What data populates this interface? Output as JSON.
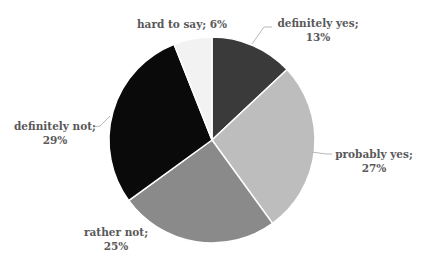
{
  "chart_data": {
    "type": "pie",
    "title": "",
    "categories": [
      "definitely yes",
      "probably yes",
      "rather not",
      "definitely not",
      "hard to say"
    ],
    "values": [
      13,
      27,
      25,
      29,
      6
    ],
    "unit": "%",
    "colors": [
      "#3a3a3a",
      "#bdbdbd",
      "#8a8a8a",
      "#0a0a0a",
      "#f2f2f2"
    ],
    "start_angle_deg": 0,
    "direction": "clockwise",
    "legend": "none",
    "data_labels": [
      {
        "name": "definitely yes;",
        "value": "13%"
      },
      {
        "name": "probably yes;",
        "value": "27%"
      },
      {
        "name": "rather not;",
        "value": "25%"
      },
      {
        "name": "definitely not;",
        "value": "29%"
      },
      {
        "name": "hard to say; 6%",
        "value": ""
      }
    ]
  },
  "style": {
    "label_color": "#595959",
    "separator_color": "#ffffff",
    "leader_color": "#a6a6a6"
  }
}
